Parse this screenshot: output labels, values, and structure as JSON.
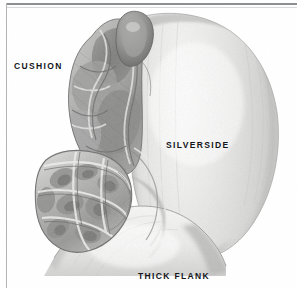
{
  "figure": {
    "kind": "anatomical-illustration",
    "medium": "graphite pencil drawing",
    "background_color": "#ffffff",
    "width": 297,
    "height": 288
  },
  "frame": {
    "top_rule_color": "#8d8f91",
    "top_rule_inner_color": "#d8d9da",
    "left_rule_color": "#b2b4b6"
  },
  "labels": [
    {
      "id": "cushion",
      "text": "CUSHION",
      "color": "#14161a",
      "position": "upper-left"
    },
    {
      "id": "silverside",
      "text": "SILVERSIDE",
      "color": "#14161a",
      "position": "center-right"
    },
    {
      "id": "thick_flank",
      "text": "THICK FLANK",
      "color": "#14161a",
      "position": "bottom-center"
    }
  ],
  "illustration": {
    "palette": {
      "paper": "#ffffff",
      "lightest": "#f4f4f3",
      "light": "#e6e6e5",
      "mid_light": "#d2d2d1",
      "mid": "#b8b8b7",
      "mid_dark": "#9a9a99",
      "dark": "#7d7d7c",
      "darkest": "#5e5e5d",
      "outline": "#6f6f6e"
    },
    "regions": [
      {
        "id": "silverside",
        "description": "large smooth rounded muscle mass on the right side, pale with soft vertical shading"
      },
      {
        "id": "cushion",
        "description": "upper-left lobed muscle with heavy graphite shading and folded contours"
      },
      {
        "id": "thick_flank",
        "description": "lower rounded muscle mass spanning the bottom, pale with a soft curved highlight"
      },
      {
        "id": "cut_face",
        "description": "lower-left exposed cut surface showing marbled, fibrous muscle texture"
      },
      {
        "id": "top_knob",
        "description": "small rounded nodule of muscle at the top of the cushion"
      }
    ]
  }
}
